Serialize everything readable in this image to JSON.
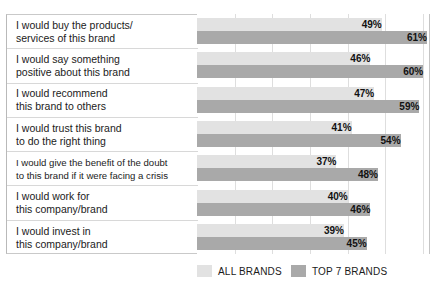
{
  "chart_data": {
    "type": "bar",
    "orientation": "horizontal",
    "title": "",
    "xlabel": "",
    "ylabel": "",
    "xlim": [
      0,
      65
    ],
    "grid": true,
    "grid_step": 10,
    "legend_position": "bottom-right",
    "categories": [
      "I would buy the products/ services of this brand",
      "I would say something positive about this brand",
      "I would recommend this brand to others",
      "I would trust this brand to do the right thing",
      "I would give the benefit of the doubt to this brand if it were facing a crisis",
      "I would work for this company/brand",
      "I would invest in this company/brand"
    ],
    "category_lines": [
      [
        "I would buy the products/",
        "services of this brand"
      ],
      [
        "I would say something",
        "positive about this brand"
      ],
      [
        "I would recommend",
        "this brand to others"
      ],
      [
        "I would trust this brand",
        "to do the right thing"
      ],
      [
        "I would give the benefit of the doubt",
        "to this brand if it were facing a crisis"
      ],
      [
        "I would work for",
        "this company/brand"
      ],
      [
        "I would invest in",
        "this company/brand"
      ]
    ],
    "series": [
      {
        "name": "ALL BRANDS",
        "color": "#e2e2e2",
        "values": [
          49,
          46,
          47,
          41,
          37,
          40,
          39
        ],
        "labels": [
          "49%",
          "46%",
          "47%",
          "41%",
          "37%",
          "40%",
          "39%"
        ]
      },
      {
        "name": "TOP 7 BRANDS",
        "color": "#a9a9a9",
        "values": [
          61,
          60,
          59,
          54,
          48,
          46,
          45
        ],
        "labels": [
          "61%",
          "60%",
          "59%",
          "54%",
          "48%",
          "46%",
          "45%"
        ]
      }
    ]
  },
  "legend": {
    "items": [
      {
        "label": "ALL BRANDS",
        "key": "all"
      },
      {
        "label": "TOP 7 BRANDS",
        "key": "top7"
      }
    ]
  },
  "colors": {
    "all_brands": "#e2e2e2",
    "top_7_brands": "#a9a9a9",
    "gridline": "#dedede",
    "row_separator": "#d8d8d8",
    "text": "#1b1b1b"
  }
}
